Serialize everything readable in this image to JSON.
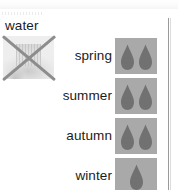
{
  "panel": {
    "group_caption": "water",
    "divider_color": "#9a9a9a",
    "background_color": "#ffffff"
  },
  "unavailable_image": {
    "icon": "crossed-out-image-icon",
    "cross_color": "#8d8d8d",
    "state": "crossed-out"
  },
  "legend": {
    "swatch_background": "#a9a9a9",
    "drop_color": "#717171",
    "drop_icon": "water-drop-icon"
  },
  "rows": [
    {
      "label": "spring",
      "drops": 2,
      "drop_count_text": "2"
    },
    {
      "label": "summer",
      "drops": 2,
      "drop_count_text": "2"
    },
    {
      "label": "autumn",
      "drops": 2,
      "drop_count_text": "2"
    },
    {
      "label": "winter",
      "drops": 1,
      "drop_count_text": "1"
    }
  ]
}
